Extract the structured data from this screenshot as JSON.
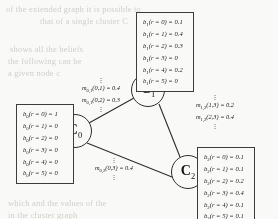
{
  "figure": {
    "type": "cluster-graph-belief-propagation",
    "nodes": [
      {
        "id": "C0",
        "label": "C",
        "subscript": "0"
      },
      {
        "id": "C1",
        "label": "C",
        "subscript": "1"
      },
      {
        "id": "C2",
        "label": "C",
        "subscript": "2"
      }
    ],
    "belief_boxes": [
      {
        "id": "belief-box-c0",
        "node": "C0",
        "lines": [
          {
            "fn": "b",
            "sub": "0",
            "var": "r",
            "value": "0",
            "prob": "1"
          },
          {
            "fn": "b",
            "sub": "0",
            "var": "r",
            "value": "1",
            "prob": "0"
          },
          {
            "fn": "b",
            "sub": "0",
            "var": "r",
            "value": "2",
            "prob": "0"
          },
          {
            "fn": "b",
            "sub": "0",
            "var": "r",
            "value": "3",
            "prob": "0"
          },
          {
            "fn": "b",
            "sub": "0",
            "var": "r",
            "value": "4",
            "prob": "0"
          },
          {
            "fn": "b",
            "sub": "0",
            "var": "r",
            "value": "5",
            "prob": "0"
          }
        ]
      },
      {
        "id": "belief-box-c1",
        "node": "C1",
        "lines": [
          {
            "fn": "b",
            "sub": "1",
            "var": "r",
            "value": "0",
            "prob": "0.1"
          },
          {
            "fn": "b",
            "sub": "1",
            "var": "r",
            "value": "1",
            "prob": "0.4"
          },
          {
            "fn": "b",
            "sub": "1",
            "var": "r",
            "value": "2",
            "prob": "0.3"
          },
          {
            "fn": "b",
            "sub": "1",
            "var": "r",
            "value": "3",
            "prob": "0"
          },
          {
            "fn": "b",
            "sub": "1",
            "var": "r",
            "value": "4",
            "prob": "0.2"
          },
          {
            "fn": "b",
            "sub": "1",
            "var": "r",
            "value": "5",
            "prob": "0"
          }
        ]
      },
      {
        "id": "belief-box-c2",
        "node": "C2",
        "lines": [
          {
            "fn": "b",
            "sub": "2",
            "var": "r",
            "value": "0",
            "prob": "0.1"
          },
          {
            "fn": "b",
            "sub": "2",
            "var": "r",
            "value": "1",
            "prob": "0.1"
          },
          {
            "fn": "b",
            "sub": "2",
            "var": "r",
            "value": "2",
            "prob": "0.2"
          },
          {
            "fn": "b",
            "sub": "2",
            "var": "r",
            "value": "3",
            "prob": "0.4"
          },
          {
            "fn": "b",
            "sub": "2",
            "var": "r",
            "value": "4",
            "prob": "0.1"
          },
          {
            "fn": "b",
            "sub": "2",
            "var": "r",
            "value": "5",
            "prob": "0.1"
          }
        ]
      }
    ],
    "messages": [
      {
        "id": "message-c0-c1",
        "edge": "C0-C1",
        "lines": [
          {
            "fn": "m",
            "sub": "0,1",
            "args": "(0,1)",
            "value": "0.4"
          },
          {
            "fn": "m",
            "sub": "0,1",
            "args": "(0,2)",
            "value": "0.3"
          }
        ]
      },
      {
        "id": "message-c1-c2",
        "edge": "C1-C2",
        "lines": [
          {
            "fn": "m",
            "sub": "1,2",
            "args": "(1,3)",
            "value": "0.2"
          },
          {
            "fn": "m",
            "sub": "1,2",
            "args": "(2,3)",
            "value": "0.4"
          }
        ]
      },
      {
        "id": "message-c0-c2",
        "edge": "C0-C2",
        "lines": [
          {
            "fn": "m",
            "sub": "0,2",
            "args": "(0,3)",
            "value": "0.4"
          }
        ]
      }
    ],
    "ellipsis": "⋮",
    "background_text": [
      "of the extended graph it is possible to",
      "that of a single cluster C",
      "shows all the beliefs",
      "the following can be",
      "a given node c",
      "which and the values of the",
      "in the cluster graph"
    ]
  }
}
